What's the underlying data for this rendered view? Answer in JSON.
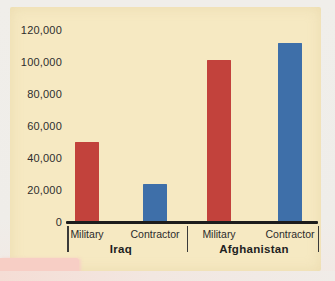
{
  "colors": {
    "page_bg": "#efede9",
    "panel_bg": "#f6e9c2",
    "pink_artifact": "#f7cec5",
    "bar_red": "#c2423c",
    "bar_blue": "#3e6fa9",
    "axis": "#1c1c1c",
    "text": "#2e2e2e"
  },
  "chart_data": {
    "type": "bar",
    "title": "",
    "ylim": [
      0,
      120000
    ],
    "ytick_interval": 20000,
    "ytick_labels_top_to_bottom": [
      "120,000",
      "100,000",
      "80,000",
      "60,000",
      "40,000",
      "20,000",
      "0"
    ],
    "grid": false,
    "legend": null,
    "groups": [
      {
        "label": "Iraq",
        "bars": [
          {
            "category": "Military",
            "value": 50000,
            "color_key": "bar_red"
          },
          {
            "category": "Contractor",
            "value": 24000,
            "color_key": "bar_blue"
          }
        ]
      },
      {
        "label": "Afghanistan",
        "bars": [
          {
            "category": "Military",
            "value": 101000,
            "color_key": "bar_red"
          },
          {
            "category": "Contractor",
            "value": 112000,
            "color_key": "bar_blue"
          }
        ]
      }
    ]
  }
}
